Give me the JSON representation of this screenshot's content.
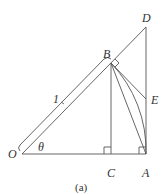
{
  "diagram": {
    "caption": "(a)",
    "points": {
      "O": {
        "label": "O",
        "x": 22,
        "y": 154
      },
      "C": {
        "label": "C",
        "x": 111,
        "y": 154
      },
      "A": {
        "label": "A",
        "x": 146,
        "y": 154
      },
      "B": {
        "label": "B",
        "x": 111,
        "y": 63
      },
      "D": {
        "label": "D",
        "x": 146,
        "y": 27
      },
      "E": {
        "label": "E",
        "x": 146,
        "y": 99
      }
    },
    "angle_label": "θ",
    "length_label": "1",
    "segments": [
      "OD",
      "OA",
      "BC",
      "AD",
      "BA",
      "BE"
    ],
    "arc": "BA centered at O",
    "right_angles": [
      "C",
      "A",
      "B"
    ],
    "colors": {
      "line": "#555555",
      "text": "#333333",
      "background": "#ffffff"
    }
  }
}
